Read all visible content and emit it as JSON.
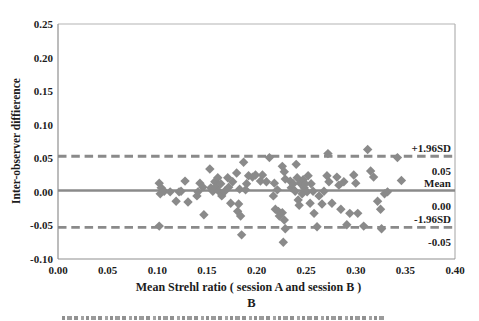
{
  "figure": {
    "panel_label": "B"
  },
  "chart_data": {
    "type": "scatter",
    "title": "",
    "xlabel": "Mean Strehl ratio ( session A and session B )",
    "ylabel": "Inter-observer diffierence",
    "xlim": [
      0.0,
      0.4
    ],
    "ylim": [
      -0.1,
      0.25
    ],
    "grid": false,
    "legend": "none",
    "x_ticks": [
      "0.00",
      "0.05",
      "0.10",
      "0.15",
      "0.20",
      "0.25",
      "0.30",
      "0.35",
      "0.40"
    ],
    "y_ticks": [
      "0.25",
      "0.20",
      "0.15",
      "0.10",
      "0.05",
      "0.00",
      "-0.05",
      "-0.10"
    ],
    "marker": "diamond",
    "colors": {
      "marker": "#8a8a8a",
      "ref_line": "#8a8a8a",
      "axis": "#8f8f8f",
      "axis_light": "#b3b3b3",
      "text": "#1c1c1c"
    },
    "lines": [
      {
        "name": "upper_limit",
        "label": "+1.96SD",
        "value_label": "0.05",
        "value": 0.053,
        "style": "dashed"
      },
      {
        "name": "mean",
        "label": "Mean",
        "value_label": "0.00",
        "value": 0.002,
        "style": "solid"
      },
      {
        "name": "lower_limit",
        "label": "-1.96SD",
        "value_label": "-0.05",
        "value": -0.053,
        "style": "dashed"
      }
    ],
    "points": [
      [
        0.102,
        0.013
      ],
      [
        0.104,
        0.006
      ],
      [
        0.107,
        0.001
      ],
      [
        0.103,
        -0.003
      ],
      [
        0.102,
        -0.051
      ],
      [
        0.113,
        0.0
      ],
      [
        0.119,
        -0.014
      ],
      [
        0.122,
        0.0
      ],
      [
        0.128,
        0.016
      ],
      [
        0.124,
        0.001
      ],
      [
        0.131,
        -0.015
      ],
      [
        0.14,
        -0.006
      ],
      [
        0.143,
        0.013
      ],
      [
        0.141,
        0.0
      ],
      [
        0.146,
        0.007
      ],
      [
        0.147,
        -0.034
      ],
      [
        0.153,
        0.034
      ],
      [
        0.154,
        0.006
      ],
      [
        0.156,
        0.001
      ],
      [
        0.158,
        0.015
      ],
      [
        0.159,
        0.007
      ],
      [
        0.161,
        0.021
      ],
      [
        0.162,
        0.001
      ],
      [
        0.164,
        0.012
      ],
      [
        0.165,
        -0.006
      ],
      [
        0.168,
        0.001
      ],
      [
        0.171,
        0.021
      ],
      [
        0.172,
        0.007
      ],
      [
        0.174,
        -0.017
      ],
      [
        0.176,
        0.015
      ],
      [
        0.18,
        0.028
      ],
      [
        0.183,
        0.004
      ],
      [
        0.182,
        -0.018
      ],
      [
        0.181,
        -0.029
      ],
      [
        0.184,
        -0.036
      ],
      [
        0.185,
        -0.064
      ],
      [
        0.187,
        0.044
      ],
      [
        0.189,
        0.003
      ],
      [
        0.19,
        0.012
      ],
      [
        0.192,
        0.024
      ],
      [
        0.196,
        0.022
      ],
      [
        0.199,
        0.025
      ],
      [
        0.204,
        0.016
      ],
      [
        0.206,
        0.025
      ],
      [
        0.21,
        0.015
      ],
      [
        0.213,
        0.051
      ],
      [
        0.217,
        -0.006
      ],
      [
        0.218,
        0.013
      ],
      [
        0.221,
        0.003
      ],
      [
        0.219,
        -0.026
      ],
      [
        0.222,
        -0.029
      ],
      [
        0.223,
        -0.036
      ],
      [
        0.226,
        0.038
      ],
      [
        0.228,
        0.03
      ],
      [
        0.229,
        0.019
      ],
      [
        0.226,
        -0.031
      ],
      [
        0.228,
        -0.042
      ],
      [
        0.229,
        -0.055
      ],
      [
        0.227,
        -0.075
      ],
      [
        0.234,
        0.016
      ],
      [
        0.235,
        0.006
      ],
      [
        0.237,
        0.012
      ],
      [
        0.239,
        0.001
      ],
      [
        0.24,
        0.041
      ],
      [
        0.241,
        0.021
      ],
      [
        0.242,
        -0.012
      ],
      [
        0.243,
        -0.02
      ],
      [
        0.244,
        0.013
      ],
      [
        0.246,
        -0.003
      ],
      [
        0.247,
        0.018
      ],
      [
        0.248,
        0.006
      ],
      [
        0.249,
        0.012
      ],
      [
        0.251,
        0.0
      ],
      [
        0.252,
        0.024
      ],
      [
        0.254,
        -0.017
      ],
      [
        0.255,
        0.012
      ],
      [
        0.257,
        0.001
      ],
      [
        0.258,
        -0.032
      ],
      [
        0.261,
        -0.052
      ],
      [
        0.263,
        -0.006
      ],
      [
        0.266,
        -0.018
      ],
      [
        0.268,
        0.001
      ],
      [
        0.271,
        0.024
      ],
      [
        0.272,
        0.057
      ],
      [
        0.273,
        0.015
      ],
      [
        0.276,
        -0.017
      ],
      [
        0.281,
        0.022
      ],
      [
        0.283,
        0.01
      ],
      [
        0.285,
        -0.026
      ],
      [
        0.288,
        0.015
      ],
      [
        0.291,
        -0.049
      ],
      [
        0.294,
        -0.032
      ],
      [
        0.298,
        0.025
      ],
      [
        0.3,
        0.013
      ],
      [
        0.302,
        -0.032
      ],
      [
        0.308,
        -0.051
      ],
      [
        0.312,
        0.063
      ],
      [
        0.315,
        0.031
      ],
      [
        0.318,
        0.022
      ],
      [
        0.322,
        -0.014
      ],
      [
        0.325,
        -0.026
      ],
      [
        0.326,
        -0.055
      ],
      [
        0.329,
        -0.003
      ],
      [
        0.332,
        0.0
      ],
      [
        0.342,
        0.051
      ],
      [
        0.346,
        0.017
      ]
    ]
  }
}
